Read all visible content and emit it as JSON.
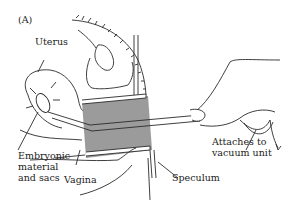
{
  "figure": {
    "panel_label": "(A)",
    "labels": {
      "uterus": "Uterus",
      "embryonic_1": "Embryonic",
      "embryonic_2": "material",
      "embryonic_3": "and sacs",
      "vagina": "Vagina",
      "speculum": "Speculum",
      "vacuum_1": "Attaches to",
      "vacuum_2": "vacuum unit"
    },
    "colors": {
      "line": "#2a2a2a",
      "shade": "#8a8a8a",
      "background": "#ffffff"
    }
  }
}
